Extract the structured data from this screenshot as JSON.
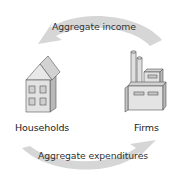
{
  "diagram": {
    "type": "circular-flow",
    "nodes": {
      "households": {
        "label": "Households",
        "icon": "house-icon"
      },
      "firms": {
        "label": "Firms",
        "icon": "factory-icon"
      }
    },
    "flows": {
      "income": {
        "label": "Aggregate income",
        "from": "Firms",
        "to": "Households",
        "direction": "right-to-left",
        "position": "top"
      },
      "expenditures": {
        "label": "Aggregate expenditures",
        "from": "Households",
        "to": "Firms",
        "direction": "left-to-right",
        "position": "bottom"
      }
    },
    "colors": {
      "arrow_fill": "#d4d4d4",
      "building_light": "#e6e6e6",
      "building_mid": "#cfcfcf",
      "building_dark": "#b5b5b5",
      "outline": "#555555",
      "text": "#222222"
    }
  }
}
